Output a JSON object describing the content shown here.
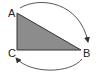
{
  "diagram": {
    "type": "triangle-with-rotation-arrows",
    "fill_color": "#8c8c8c",
    "stroke_color": "#333333",
    "vertices": [
      {
        "label": "A",
        "x": 17,
        "y": 13
      },
      {
        "label": "B",
        "x": 81,
        "y": 50
      },
      {
        "label": "C",
        "x": 17,
        "y": 50
      }
    ],
    "labels": {
      "a": "A",
      "b": "B",
      "c": "C"
    },
    "arrows": [
      {
        "from": "A",
        "to": "B",
        "position": "top"
      },
      {
        "from": "B",
        "to": "C",
        "position": "bottom"
      }
    ]
  }
}
